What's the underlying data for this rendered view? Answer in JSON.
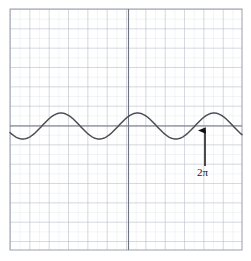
{
  "figure": {
    "name": "sine-wave-graph",
    "background_color": "#ffffff",
    "width": 251,
    "height": 261
  },
  "grid": {
    "left": 10,
    "top": 9,
    "right": 242,
    "bottom": 250,
    "minor_step": 9.67,
    "major_every": 2,
    "minor_color": "#d9dde6",
    "major_color": "#aab0bd",
    "border_color": "#9aa0ad",
    "visible": true
  },
  "axes": {
    "x_axis_y": 126,
    "y_axis_x": 128.5,
    "color": "#6e7480",
    "width": 1.1
  },
  "annotation": {
    "label": "2π",
    "arrow": {
      "tip_x": 205,
      "tip_y": 130,
      "tail_x": 205,
      "tail_y": 166,
      "color": "#111111"
    },
    "label_color": "#1a1a1a"
  },
  "chart_data": {
    "type": "line",
    "title": "",
    "xlabel": "",
    "ylabel": "",
    "function": "y = cos(x)",
    "curve_color": "#4a4a52",
    "curve_width": 1.4,
    "amplitude": 13,
    "midline_y": 126,
    "period_px": 76.5,
    "phase_start_x": 10,
    "start_phase_deg": 120,
    "xlim": [
      10,
      242
    ],
    "ylim": [
      250,
      9
    ],
    "grid": true,
    "legend": null,
    "annotations": [
      {
        "text": "2π",
        "x": 205,
        "y": 166,
        "arrow_to_x": 205,
        "arrow_to_y": 130
      }
    ],
    "peaks_px": [
      [
        63,
        113
      ],
      [
        139,
        113
      ],
      [
        216,
        113
      ]
    ],
    "troughs_px": [
      [
        33,
        139
      ],
      [
        101,
        139
      ],
      [
        177,
        139
      ]
    ],
    "sample_points": [
      [
        10,
        122
      ],
      [
        16,
        128
      ],
      [
        22,
        134
      ],
      [
        28,
        138
      ],
      [
        33,
        139
      ],
      [
        39,
        138
      ],
      [
        45,
        134
      ],
      [
        51,
        128
      ],
      [
        57,
        119
      ],
      [
        63,
        113
      ],
      [
        69,
        114
      ],
      [
        75,
        119
      ],
      [
        82,
        127
      ],
      [
        88,
        133
      ],
      [
        95,
        138
      ],
      [
        101,
        139
      ],
      [
        107,
        138
      ],
      [
        113,
        134
      ],
      [
        120,
        127
      ],
      [
        126,
        120
      ],
      [
        132,
        114
      ],
      [
        139,
        113
      ],
      [
        145,
        115
      ],
      [
        151,
        120
      ],
      [
        158,
        128
      ],
      [
        164,
        134
      ],
      [
        171,
        138
      ],
      [
        177,
        139
      ],
      [
        183,
        138
      ],
      [
        190,
        134
      ],
      [
        196,
        128
      ],
      [
        202,
        121
      ],
      [
        209,
        114
      ],
      [
        216,
        113
      ],
      [
        222,
        114
      ],
      [
        228,
        119
      ],
      [
        235,
        127
      ],
      [
        242,
        134
      ]
    ]
  }
}
